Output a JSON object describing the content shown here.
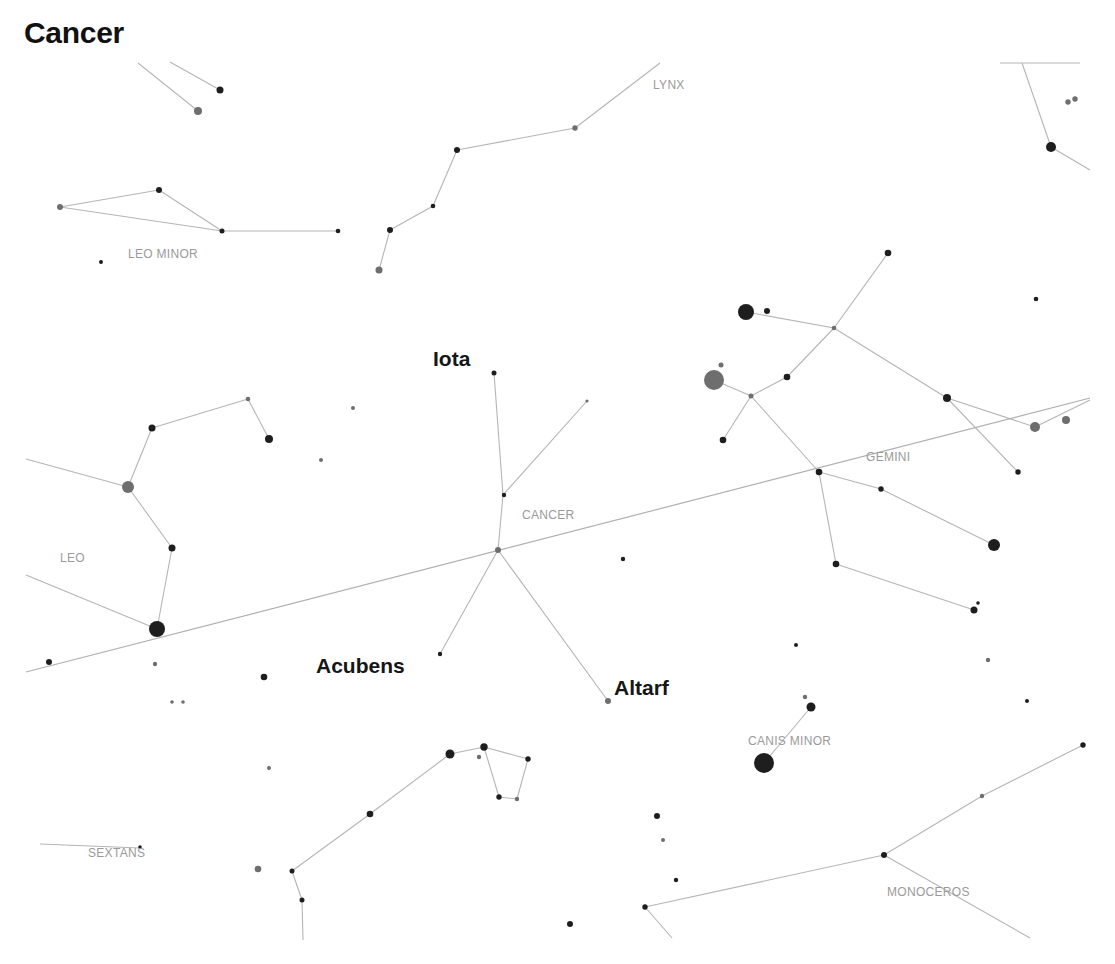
{
  "title": "Cancer",
  "colors": {
    "background": "#ffffff",
    "line": "#b5b5b5",
    "constellation_label": "#9a9a9a",
    "star_dark": "#1e1e1e",
    "star_grey": "#6e6e6e",
    "star_label": "#161616"
  },
  "constellation_labels": [
    {
      "name": "LYNX",
      "x": 653,
      "y": 89
    },
    {
      "name": "LEO MINOR",
      "x": 128,
      "y": 258
    },
    {
      "name": "LEO",
      "x": 60,
      "y": 562
    },
    {
      "name": "CANCER",
      "x": 522,
      "y": 519
    },
    {
      "name": "GEMINI",
      "x": 866,
      "y": 461
    },
    {
      "name": "CANIS MINOR",
      "x": 748,
      "y": 745
    },
    {
      "name": "SEXTANS",
      "x": 88,
      "y": 857
    },
    {
      "name": "MONOCEROS",
      "x": 887,
      "y": 896
    }
  ],
  "star_labels": [
    {
      "name": "Iota",
      "x": 433,
      "y": 366
    },
    {
      "name": "Acubens",
      "x": 316,
      "y": 673
    },
    {
      "name": "Altarf",
      "x": 614,
      "y": 695
    }
  ],
  "ecliptic": {
    "x1": 26,
    "y1": 672,
    "x2": 1090,
    "y2": 398
  },
  "lines": [
    [
      138,
      63,
      198,
      111
    ],
    [
      170,
      62,
      220,
      90
    ],
    [
      60,
      207,
      159,
      190
    ],
    [
      159,
      190,
      222,
      231
    ],
    [
      60,
      207,
      222,
      231
    ],
    [
      222,
      231,
      338,
      231
    ],
    [
      379,
      270,
      390,
      230
    ],
    [
      390,
      230,
      433,
      206
    ],
    [
      433,
      206,
      457,
      150
    ],
    [
      457,
      150,
      575,
      128
    ],
    [
      575,
      128,
      660,
      63
    ],
    [
      1022,
      63,
      1051,
      147
    ],
    [
      1051,
      147,
      1090,
      170
    ],
    [
      1000,
      63,
      1080,
      63
    ],
    [
      494,
      373,
      503,
      495
    ],
    [
      503,
      495,
      498,
      550
    ],
    [
      503,
      495,
      587,
      401
    ],
    [
      498,
      550,
      440,
      654
    ],
    [
      498,
      550,
      608,
      701
    ],
    [
      26,
      459,
      128,
      487
    ],
    [
      128,
      487,
      152,
      428
    ],
    [
      152,
      428,
      248,
      399
    ],
    [
      248,
      399,
      269,
      439
    ],
    [
      128,
      487,
      172,
      548
    ],
    [
      172,
      548,
      157,
      629
    ],
    [
      26,
      575,
      157,
      629
    ],
    [
      714,
      380,
      751,
      396
    ],
    [
      751,
      396,
      787,
      377
    ],
    [
      787,
      377,
      834,
      328
    ],
    [
      834,
      328,
      888,
      253
    ],
    [
      746,
      312,
      834,
      328
    ],
    [
      834,
      328,
      947,
      398
    ],
    [
      947,
      398,
      1035,
      427
    ],
    [
      1035,
      427,
      1090,
      400
    ],
    [
      947,
      398,
      1018,
      472
    ],
    [
      751,
      396,
      723,
      440
    ],
    [
      751,
      396,
      819,
      472
    ],
    [
      819,
      472,
      881,
      489
    ],
    [
      881,
      489,
      994,
      545
    ],
    [
      819,
      472,
      836,
      564
    ],
    [
      836,
      564,
      974,
      610
    ],
    [
      811,
      707,
      764,
      763
    ],
    [
      450,
      754,
      484,
      747
    ],
    [
      484,
      747,
      499,
      797
    ],
    [
      499,
      797,
      517,
      799
    ],
    [
      517,
      799,
      528,
      759
    ],
    [
      528,
      759,
      484,
      747
    ],
    [
      450,
      754,
      370,
      814
    ],
    [
      370,
      814,
      292,
      871
    ],
    [
      292,
      871,
      302,
      900
    ],
    [
      302,
      900,
      303,
      940
    ],
    [
      40,
      844,
      140,
      848
    ],
    [
      645,
      907,
      884,
      855
    ],
    [
      884,
      855,
      982,
      796
    ],
    [
      982,
      796,
      1083,
      745
    ],
    [
      884,
      855,
      1030,
      938
    ],
    [
      645,
      907,
      672,
      938
    ]
  ],
  "stars": [
    {
      "x": 198,
      "y": 111,
      "r": 4,
      "tone": "grey"
    },
    {
      "x": 220,
      "y": 90,
      "r": 3.5,
      "tone": "dark"
    },
    {
      "x": 60,
      "y": 207,
      "r": 3,
      "tone": "grey"
    },
    {
      "x": 159,
      "y": 190,
      "r": 3,
      "tone": "dark"
    },
    {
      "x": 222,
      "y": 231,
      "r": 2.5,
      "tone": "dark"
    },
    {
      "x": 338,
      "y": 231,
      "r": 2.3,
      "tone": "dark"
    },
    {
      "x": 101,
      "y": 262,
      "r": 2,
      "tone": "dark"
    },
    {
      "x": 379,
      "y": 270,
      "r": 3.5,
      "tone": "grey"
    },
    {
      "x": 390,
      "y": 230,
      "r": 3,
      "tone": "dark"
    },
    {
      "x": 433,
      "y": 206,
      "r": 2.3,
      "tone": "dark"
    },
    {
      "x": 457,
      "y": 150,
      "r": 3,
      "tone": "dark"
    },
    {
      "x": 575,
      "y": 128,
      "r": 2.7,
      "tone": "grey"
    },
    {
      "x": 1051,
      "y": 147,
      "r": 5,
      "tone": "dark"
    },
    {
      "x": 1068,
      "y": 102,
      "r": 2.7,
      "tone": "grey"
    },
    {
      "x": 1075,
      "y": 99,
      "r": 2.7,
      "tone": "grey"
    },
    {
      "x": 494,
      "y": 373,
      "r": 2.5,
      "tone": "dark"
    },
    {
      "x": 587,
      "y": 401,
      "r": 1.6,
      "tone": "grey"
    },
    {
      "x": 504,
      "y": 495,
      "r": 2.2,
      "tone": "dark"
    },
    {
      "x": 498,
      "y": 550,
      "r": 3,
      "tone": "grey"
    },
    {
      "x": 440,
      "y": 654,
      "r": 2.2,
      "tone": "dark"
    },
    {
      "x": 608,
      "y": 701,
      "r": 3,
      "tone": "grey"
    },
    {
      "x": 353,
      "y": 408,
      "r": 2,
      "tone": "grey"
    },
    {
      "x": 321,
      "y": 460,
      "r": 2,
      "tone": "grey"
    },
    {
      "x": 623,
      "y": 559,
      "r": 2.2,
      "tone": "dark"
    },
    {
      "x": 152,
      "y": 428,
      "r": 3.5,
      "tone": "dark"
    },
    {
      "x": 248,
      "y": 399,
      "r": 2.3,
      "tone": "grey"
    },
    {
      "x": 269,
      "y": 439,
      "r": 4,
      "tone": "dark"
    },
    {
      "x": 128,
      "y": 487,
      "r": 6,
      "tone": "grey"
    },
    {
      "x": 172,
      "y": 548,
      "r": 3.5,
      "tone": "dark"
    },
    {
      "x": 157,
      "y": 629,
      "r": 8,
      "tone": "dark"
    },
    {
      "x": 49,
      "y": 662,
      "r": 3,
      "tone": "dark"
    },
    {
      "x": 155,
      "y": 664,
      "r": 2.2,
      "tone": "grey"
    },
    {
      "x": 264,
      "y": 677,
      "r": 3.3,
      "tone": "dark"
    },
    {
      "x": 183,
      "y": 702,
      "r": 1.8,
      "tone": "grey"
    },
    {
      "x": 746,
      "y": 312,
      "r": 8,
      "tone": "dark"
    },
    {
      "x": 767,
      "y": 311,
      "r": 3,
      "tone": "dark"
    },
    {
      "x": 714,
      "y": 380,
      "r": 10,
      "tone": "grey"
    },
    {
      "x": 721,
      "y": 365,
      "r": 2.5,
      "tone": "grey"
    },
    {
      "x": 751,
      "y": 396,
      "r": 2.5,
      "tone": "grey"
    },
    {
      "x": 787,
      "y": 377,
      "r": 3.3,
      "tone": "dark"
    },
    {
      "x": 834,
      "y": 328,
      "r": 2.3,
      "tone": "grey"
    },
    {
      "x": 888,
      "y": 253,
      "r": 3.3,
      "tone": "dark"
    },
    {
      "x": 1036,
      "y": 299,
      "r": 2.3,
      "tone": "dark"
    },
    {
      "x": 723,
      "y": 440,
      "r": 3.3,
      "tone": "dark"
    },
    {
      "x": 947,
      "y": 398,
      "r": 4,
      "tone": "dark"
    },
    {
      "x": 1035,
      "y": 427,
      "r": 5,
      "tone": "grey"
    },
    {
      "x": 1066,
      "y": 420,
      "r": 4,
      "tone": "grey"
    },
    {
      "x": 1018,
      "y": 472,
      "r": 2.7,
      "tone": "dark"
    },
    {
      "x": 819,
      "y": 472,
      "r": 3.3,
      "tone": "dark"
    },
    {
      "x": 881,
      "y": 489,
      "r": 2.7,
      "tone": "dark"
    },
    {
      "x": 994,
      "y": 545,
      "r": 6,
      "tone": "dark"
    },
    {
      "x": 836,
      "y": 564,
      "r": 3.3,
      "tone": "dark"
    },
    {
      "x": 974,
      "y": 610,
      "r": 3.5,
      "tone": "dark"
    },
    {
      "x": 978,
      "y": 603,
      "r": 1.8,
      "tone": "dark"
    },
    {
      "x": 796,
      "y": 645,
      "r": 2,
      "tone": "dark"
    },
    {
      "x": 988,
      "y": 660,
      "r": 2.2,
      "tone": "grey"
    },
    {
      "x": 1027,
      "y": 701,
      "r": 2,
      "tone": "dark"
    },
    {
      "x": 805,
      "y": 697,
      "r": 2.2,
      "tone": "grey"
    },
    {
      "x": 811,
      "y": 707,
      "r": 4.5,
      "tone": "dark"
    },
    {
      "x": 764,
      "y": 763,
      "r": 10,
      "tone": "dark"
    },
    {
      "x": 172,
      "y": 702,
      "r": 1.8,
      "tone": "grey"
    },
    {
      "x": 269,
      "y": 768,
      "r": 2,
      "tone": "grey"
    },
    {
      "x": 450,
      "y": 754,
      "r": 4.5,
      "tone": "dark"
    },
    {
      "x": 484,
      "y": 747,
      "r": 3.7,
      "tone": "dark"
    },
    {
      "x": 479,
      "y": 757,
      "r": 2.2,
      "tone": "grey"
    },
    {
      "x": 528,
      "y": 759,
      "r": 2.7,
      "tone": "dark"
    },
    {
      "x": 499,
      "y": 797,
      "r": 2.7,
      "tone": "dark"
    },
    {
      "x": 517,
      "y": 799,
      "r": 2.2,
      "tone": "grey"
    },
    {
      "x": 370,
      "y": 814,
      "r": 3.3,
      "tone": "dark"
    },
    {
      "x": 258,
      "y": 869,
      "r": 3.3,
      "tone": "grey"
    },
    {
      "x": 292,
      "y": 871,
      "r": 2.5,
      "tone": "dark"
    },
    {
      "x": 302,
      "y": 900,
      "r": 2.5,
      "tone": "dark"
    },
    {
      "x": 140,
      "y": 847,
      "r": 1.8,
      "tone": "dark"
    },
    {
      "x": 657,
      "y": 816,
      "r": 3,
      "tone": "dark"
    },
    {
      "x": 663,
      "y": 840,
      "r": 2,
      "tone": "grey"
    },
    {
      "x": 676,
      "y": 880,
      "r": 2.2,
      "tone": "dark"
    },
    {
      "x": 645,
      "y": 907,
      "r": 2.7,
      "tone": "dark"
    },
    {
      "x": 570,
      "y": 924,
      "r": 3,
      "tone": "dark"
    },
    {
      "x": 884,
      "y": 855,
      "r": 3,
      "tone": "dark"
    },
    {
      "x": 982,
      "y": 796,
      "r": 2.2,
      "tone": "grey"
    },
    {
      "x": 1083,
      "y": 745,
      "r": 2.7,
      "tone": "dark"
    }
  ]
}
